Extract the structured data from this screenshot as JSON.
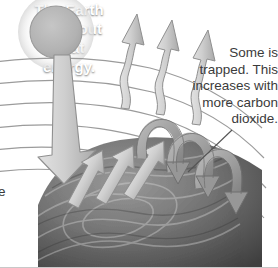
{
  "diagram": {
    "background_color": "#ffffff"
  },
  "captions": {
    "trapped": "Some is\ntrapped. This\nincreases with\nmore carbon\ndioxide.",
    "earth": "The Earth\ngives out\nheat\nenergy.",
    "edge_fragment": "e"
  },
  "colors": {
    "text": "#3b3b3b",
    "earth_text": "#ffffff",
    "sun_fill": "#b4b4b4",
    "sun_stroke": "#9a9a9a",
    "arrow_fill": "#c9c9c9",
    "arrow_stroke": "#8a8a8a",
    "curve_stroke": "#9b9b9b",
    "earth_dark": "#4a4a4a",
    "earth_light": "#8e8e8e",
    "leader_line": "#555555"
  },
  "elements": {
    "sun": "sun-disc",
    "incoming_arrow": "incoming-solar-arrow",
    "escaping_arrows": "escaping-heat-arrows",
    "surface_arrows": "surface-emission-arrows",
    "trapped_arrows": "trapped-heat-uturn-arrows",
    "atmosphere_layers": "atmosphere-layer-curves",
    "earth_body": "earth-surface",
    "leader": "caption-leader-line"
  }
}
